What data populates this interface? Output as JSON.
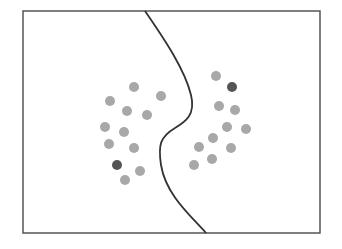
{
  "diagram": {
    "frame": {
      "x": 23,
      "y": 11,
      "w": 297,
      "h": 222,
      "stroke": "#555555"
    },
    "boundary": {
      "path": "M145,11 C165,40 185,70 191,95 C196,115 185,122 175,128 C160,137 158,145 161,165 C166,195 190,215 206,233",
      "stroke": "#333333"
    },
    "colors": {
      "light": "#a8a8a8",
      "dark": "#555555"
    },
    "left_points": [
      [
        134,
        87,
        "light"
      ],
      [
        110,
        101,
        "light"
      ],
      [
        161,
        96,
        "light"
      ],
      [
        127,
        111,
        "light"
      ],
      [
        147,
        115,
        "light"
      ],
      [
        105,
        127,
        "light"
      ],
      [
        124,
        132,
        "light"
      ],
      [
        109,
        144,
        "light"
      ],
      [
        134,
        148,
        "light"
      ],
      [
        117,
        165,
        "dark"
      ],
      [
        140,
        171,
        "light"
      ],
      [
        125,
        180,
        "light"
      ]
    ],
    "right_points": [
      [
        216,
        76,
        "light"
      ],
      [
        232,
        87,
        "dark"
      ],
      [
        219,
        106,
        "light"
      ],
      [
        235,
        110,
        "light"
      ],
      [
        227,
        127,
        "light"
      ],
      [
        246,
        129,
        "light"
      ],
      [
        213,
        138,
        "light"
      ],
      [
        199,
        147,
        "light"
      ],
      [
        231,
        148,
        "light"
      ],
      [
        212,
        159,
        "light"
      ],
      [
        194,
        165,
        "light"
      ]
    ]
  }
}
